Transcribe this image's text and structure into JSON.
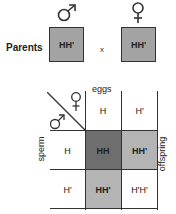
{
  "parents": {
    "label": "Parents",
    "male": {
      "symbol": "male-symbol",
      "genotype": "HH'"
    },
    "cross": "x",
    "female": {
      "symbol": "female-symbol",
      "genotype": "HH'"
    }
  },
  "punnett": {
    "eggs_label": "eggs",
    "sperm_label": "sperm",
    "offspring_label": "offspring",
    "corner": {
      "top_symbol": "female-symbol",
      "bottom_symbol": "male-symbol"
    },
    "egg_alleles": [
      "H",
      "H'"
    ],
    "sperm_alleles": [
      "H",
      "H'"
    ],
    "offspring": [
      [
        "HH",
        "HH'"
      ],
      [
        "HH'",
        "H'H'"
      ]
    ],
    "colors": {
      "HH": "#6e6e6e",
      "HH'": "#b4b4b4",
      "H'H'": "#ffffff",
      "parent_box": "#a3a3a3"
    }
  }
}
